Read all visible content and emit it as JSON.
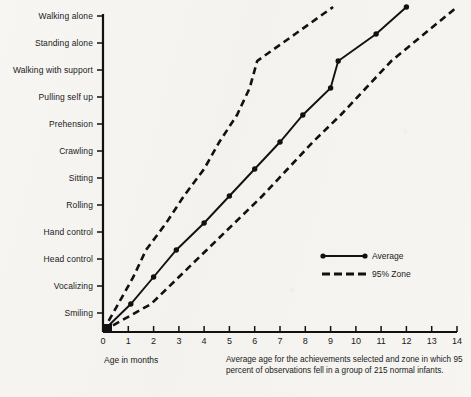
{
  "chart_data": {
    "type": "line",
    "title": "",
    "xlabel": "Age in months",
    "ylabel": "",
    "xlim": [
      0,
      14
    ],
    "xticks": [
      "0",
      "1",
      "2",
      "3",
      "4",
      "5",
      "6",
      "7",
      "8",
      "9",
      "10",
      "11",
      "12",
      "13",
      "14"
    ],
    "categories": [
      "Smiling",
      "Vocalizing",
      "Head control",
      "Hand control",
      "Rolling",
      "Sitting",
      "Crawling",
      "Prehension",
      "Pulling self up",
      "Walking with support",
      "Standing alone",
      "Walking alone"
    ],
    "grid": false,
    "legend_position": "center-right",
    "series": [
      {
        "name": "Average",
        "style": "solid-with-markers",
        "color": "#111111",
        "points": [
          {
            "milestone": "origin",
            "age_months": 0.0
          },
          {
            "milestone": "Smiling",
            "age_months": 1.1
          },
          {
            "milestone": "Vocalizing",
            "age_months": 2.0
          },
          {
            "milestone": "Head control",
            "age_months": 2.9
          },
          {
            "milestone": "Hand control",
            "age_months": 4.0
          },
          {
            "milestone": "Rolling",
            "age_months": 5.0
          },
          {
            "milestone": "Sitting",
            "age_months": 6.0
          },
          {
            "milestone": "Crawling",
            "age_months": 7.0
          },
          {
            "milestone": "Prehension",
            "age_months": 7.9
          },
          {
            "milestone": "Pulling self up",
            "age_months": 9.0
          },
          {
            "milestone": "Walking with support",
            "age_months": 9.3
          },
          {
            "milestone": "Standing alone",
            "age_months": 10.8
          },
          {
            "milestone": "Walking alone",
            "age_months": 12.0
          }
        ]
      },
      {
        "name": "95% Zone lower bound",
        "style": "dashed",
        "color": "#111111",
        "points": [
          {
            "milestone": "origin",
            "age_months": 0.0
          },
          {
            "milestone": "Smiling",
            "age_months": 0.6
          },
          {
            "milestone": "Vocalizing",
            "age_months": 1.2
          },
          {
            "milestone": "Head control",
            "age_months": 1.7
          },
          {
            "milestone": "Hand control",
            "age_months": 2.5
          },
          {
            "milestone": "Rolling",
            "age_months": 3.2
          },
          {
            "milestone": "Sitting",
            "age_months": 4.0
          },
          {
            "milestone": "Crawling",
            "age_months": 4.6
          },
          {
            "milestone": "Prehension",
            "age_months": 5.3
          },
          {
            "milestone": "Pulling self up",
            "age_months": 5.8
          },
          {
            "milestone": "Walking with support",
            "age_months": 6.1
          },
          {
            "milestone": "Standing alone",
            "age_months": 7.6
          },
          {
            "milestone": "Walking alone",
            "age_months": 9.1
          }
        ]
      },
      {
        "name": "95% Zone upper bound",
        "style": "dashed",
        "color": "#111111",
        "points": [
          {
            "milestone": "origin",
            "age_months": 0.0
          },
          {
            "milestone": "Smiling",
            "age_months": 1.9
          },
          {
            "milestone": "Vocalizing",
            "age_months": 3.0
          },
          {
            "milestone": "Head control",
            "age_months": 4.1
          },
          {
            "milestone": "Hand control",
            "age_months": 5.2
          },
          {
            "milestone": "Rolling",
            "age_months": 6.3
          },
          {
            "milestone": "Sitting",
            "age_months": 7.3
          },
          {
            "milestone": "Crawling",
            "age_months": 8.3
          },
          {
            "milestone": "Prehension",
            "age_months": 9.4
          },
          {
            "milestone": "Pulling self up",
            "age_months": 10.4
          },
          {
            "milestone": "Walking with support",
            "age_months": 11.4
          },
          {
            "milestone": "Standing alone",
            "age_months": 12.7
          },
          {
            "milestone": "Walking alone",
            "age_months": 14.0
          }
        ]
      }
    ],
    "legend": [
      {
        "label": "Average",
        "style": "solid-with-markers"
      },
      {
        "label": "95% Zone",
        "style": "dashed"
      }
    ],
    "caption": "Average age for the achievements selected and zone in which 95 percent of observations fell in a group of 215 normal infants."
  }
}
